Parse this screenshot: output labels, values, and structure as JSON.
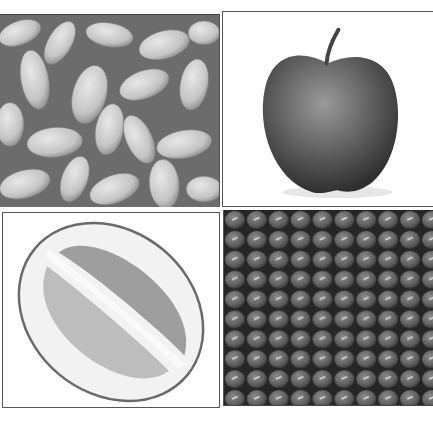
{
  "figure": {
    "layout": "2x2 grid",
    "color_mode": "grayscale",
    "panels": [
      {
        "id": "top-left",
        "subject": "white kidney beans"
      },
      {
        "id": "top-right",
        "subject": "apple"
      },
      {
        "id": "bottom-left",
        "subject": "halved lime"
      },
      {
        "id": "bottom-right",
        "subject": "mung beans"
      }
    ]
  },
  "colors": {
    "background": "#ffffff",
    "border": "#555555",
    "bean_light": "#d2d2d2",
    "apple_dark": "#5a5a5a",
    "lime_flesh": "#bdbdbd",
    "mung_dark": "#5e5e5e"
  }
}
